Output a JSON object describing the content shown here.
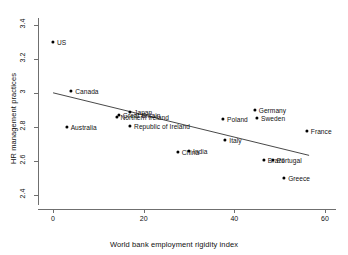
{
  "chart_data": {
    "type": "scatter",
    "title": "",
    "xlabel": "World bank employment rigidity index",
    "ylabel": "HR management practices",
    "xlim": [
      -2,
      62
    ],
    "ylim": [
      2.34,
      3.44
    ],
    "xticks": [
      "0",
      "20",
      "40",
      "60"
    ],
    "xtick_values": [
      0,
      20,
      40,
      60
    ],
    "yticks": [
      "2.4",
      "2.6",
      "2.8",
      "3",
      "3.2",
      "3.4"
    ],
    "ytick_values": [
      2.4,
      2.6,
      2.8,
      3.0,
      3.2,
      3.4
    ],
    "grid": false,
    "legend": "none",
    "marker_color": "#000000",
    "line_color": "#333333",
    "points": [
      {
        "label": "US",
        "x": 0,
        "y": 3.3,
        "label_side": "right"
      },
      {
        "label": "Canada",
        "x": 4,
        "y": 3.01,
        "label_side": "right"
      },
      {
        "label": "Australia",
        "x": 3,
        "y": 2.8,
        "label_side": "right"
      },
      {
        "label": "Northern Ireland",
        "x": 14,
        "y": 2.86,
        "label_side": "right"
      },
      {
        "label": "Great Britain",
        "x": 14.5,
        "y": 2.87,
        "label_side": "right"
      },
      {
        "label": "Japan",
        "x": 17,
        "y": 2.89,
        "label_side": "right"
      },
      {
        "label": "Republic of Ireland",
        "x": 17,
        "y": 2.805,
        "label_side": "right"
      },
      {
        "label": "China",
        "x": 27.5,
        "y": 2.65,
        "label_side": "right"
      },
      {
        "label": "India",
        "x": 30,
        "y": 2.66,
        "label_side": "right"
      },
      {
        "label": "Poland",
        "x": 37.5,
        "y": 2.845,
        "label_side": "right"
      },
      {
        "label": "Italy",
        "x": 38,
        "y": 2.725,
        "label_side": "right"
      },
      {
        "label": "Germany",
        "x": 44.5,
        "y": 2.9,
        "label_side": "right"
      },
      {
        "label": "Sweden",
        "x": 45,
        "y": 2.85,
        "label_side": "right"
      },
      {
        "label": "Brazil",
        "x": 46.5,
        "y": 2.605,
        "label_side": "right"
      },
      {
        "label": "Portugal",
        "x": 48.5,
        "y": 2.605,
        "label_side": "right"
      },
      {
        "label": "Greece",
        "x": 51,
        "y": 2.5,
        "label_side": "right"
      },
      {
        "label": "France",
        "x": 56,
        "y": 2.775,
        "label_side": "right"
      }
    ],
    "trend_line": {
      "x1": 0,
      "y1": 3.0,
      "x2": 56.5,
      "y2": 2.632
    }
  }
}
